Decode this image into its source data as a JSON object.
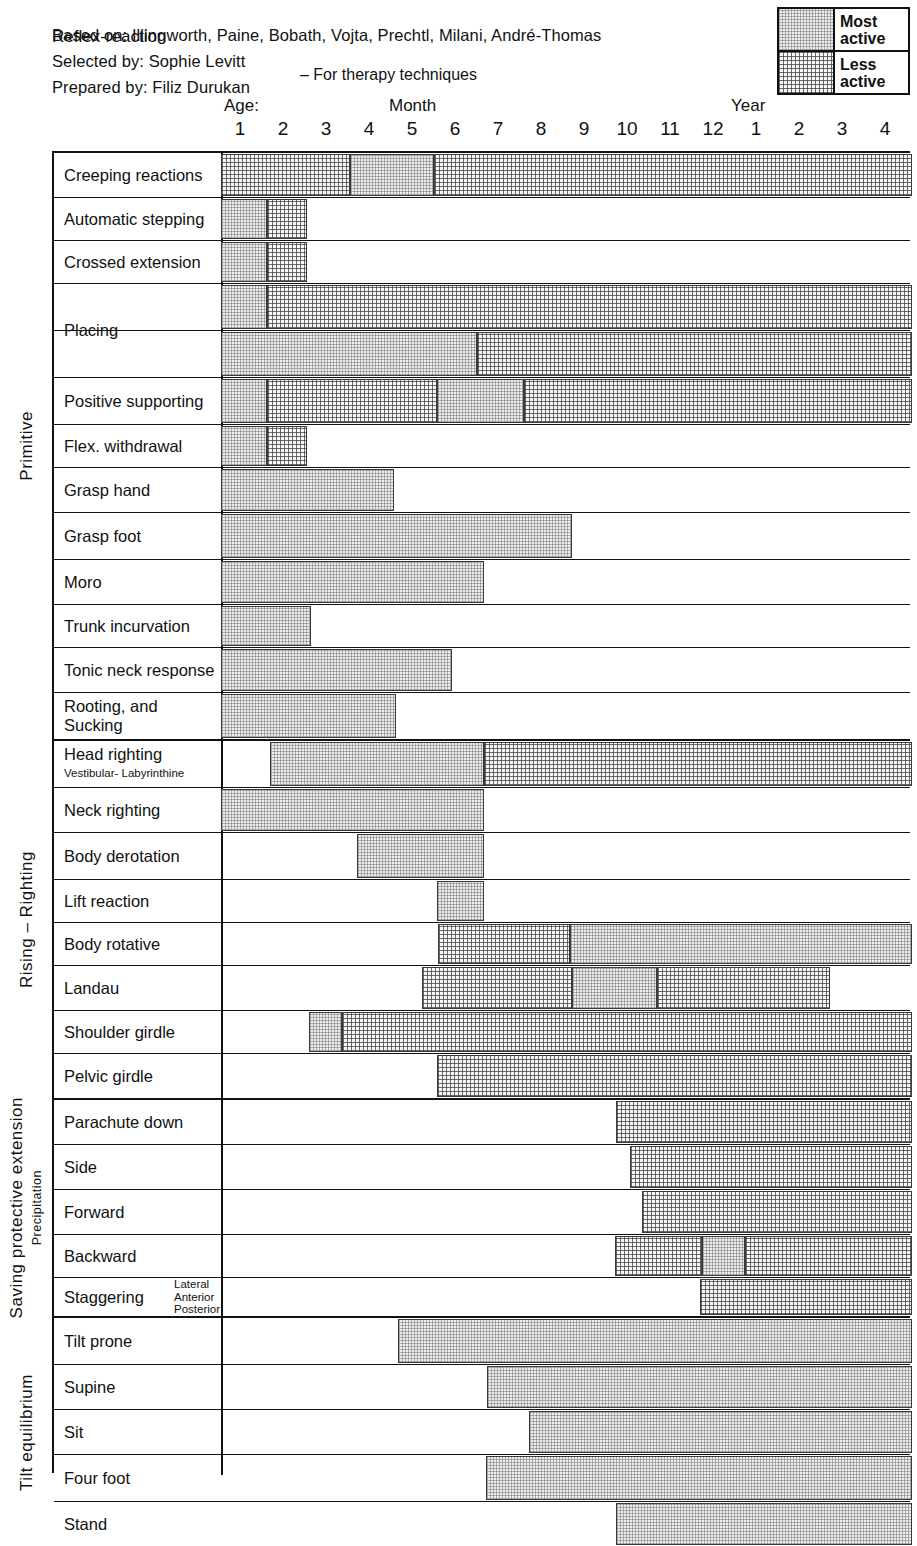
{
  "header": {
    "based_on": "Based on: Illingworth, Paine, Bobath, Vojta, Prechtl, Milani, André-Thomas",
    "selected_by": "Selected by: Sophie Levitt",
    "prepared_by": "Prepared by: Filiz Durukan",
    "therapy_note": "– For therapy techniques"
  },
  "legend": {
    "most_line1": "Most",
    "most_line2": "active",
    "less_line1": "Less",
    "less_line2": "active"
  },
  "axis": {
    "row_header": "Reflex-reaction",
    "age_word": "Age:",
    "month_word": "Month",
    "year_word": "Year",
    "tick_labels": [
      "1",
      "2",
      "3",
      "4",
      "5",
      "6",
      "7",
      "8",
      "9",
      "10",
      "11",
      "12",
      "1",
      "2",
      "3",
      "4"
    ]
  },
  "colors": {
    "most_active": "#eeeeee",
    "less_active": "#f7f7f7",
    "line": "#111111"
  },
  "chart_data": {
    "type": "bar",
    "xlabel": "Age (Months 1-12, then Years 1-4)",
    "ylabel": "Reflex-reaction",
    "grid": false,
    "legend": [
      "Most active",
      "Less active"
    ],
    "legend_position": "top-right",
    "x_axis": {
      "unit_labels": [
        "Month",
        "Year"
      ],
      "ticks": [
        "1",
        "2",
        "3",
        "4",
        "5",
        "6",
        "7",
        "8",
        "9",
        "10",
        "11",
        "12",
        "1",
        "2",
        "3",
        "4"
      ],
      "tick_px": [
        240,
        283,
        326,
        369,
        412,
        455,
        498,
        541,
        584,
        627,
        670,
        713,
        756,
        799,
        842,
        885
      ],
      "plot_left_px": 219,
      "plot_right_px": 910
    },
    "groups": [
      {
        "name": "Primitive",
        "rows": [
          {
            "label": "Creeping reactions",
            "segments": [
              {
                "type": "less",
                "from": 219,
                "to": 348
              },
              {
                "type": "most",
                "from": 348,
                "to": 432
              },
              {
                "type": "less",
                "from": 432,
                "to": 910
              }
            ]
          },
          {
            "label": "Automatic stepping",
            "segments": [
              {
                "type": "most",
                "from": 219,
                "to": 265
              },
              {
                "type": "less",
                "from": 265,
                "to": 305
              }
            ]
          },
          {
            "label": "Crossed extension",
            "segments": [
              {
                "type": "most",
                "from": 219,
                "to": 265
              },
              {
                "type": "less",
                "from": 265,
                "to": 305
              }
            ]
          },
          {
            "label": "Arms",
            "label_align": "right",
            "group_label": "Placing",
            "segments": [
              {
                "type": "most",
                "from": 219,
                "to": 265
              },
              {
                "type": "less",
                "from": 265,
                "to": 910
              }
            ]
          },
          {
            "label": "Legs",
            "label_align": "right",
            "segments": [
              {
                "type": "most",
                "from": 219,
                "to": 475
              },
              {
                "type": "less",
                "from": 475,
                "to": 910
              }
            ]
          },
          {
            "label": "Positive supporting",
            "segments": [
              {
                "type": "most",
                "from": 219,
                "to": 265
              },
              {
                "type": "less",
                "from": 265,
                "to": 435
              },
              {
                "type": "most",
                "from": 435,
                "to": 522
              },
              {
                "type": "less",
                "from": 522,
                "to": 910
              }
            ]
          },
          {
            "label": "Flex. withdrawal",
            "segments": [
              {
                "type": "most",
                "from": 219,
                "to": 265
              },
              {
                "type": "less",
                "from": 265,
                "to": 305
              }
            ]
          },
          {
            "label": "Grasp hand",
            "segments": [
              {
                "type": "most",
                "from": 219,
                "to": 392
              }
            ]
          },
          {
            "label": "Grasp foot",
            "segments": [
              {
                "type": "most",
                "from": 219,
                "to": 570
              }
            ]
          },
          {
            "label": "Moro",
            "segments": [
              {
                "type": "most",
                "from": 219,
                "to": 482
              }
            ]
          },
          {
            "label": "Trunk incurvation",
            "segments": [
              {
                "type": "most",
                "from": 219,
                "to": 309
              }
            ]
          },
          {
            "label": "Tonic neck response",
            "segments": [
              {
                "type": "most",
                "from": 219,
                "to": 450
              }
            ]
          },
          {
            "label": "Rooting, and",
            "label2": "Sucking",
            "segments": [
              {
                "type": "most",
                "from": 219,
                "to": 394
              }
            ]
          }
        ]
      },
      {
        "name": "Rising  –  Righting",
        "rows": [
          {
            "label": "Head righting",
            "sub": "Vestibular- Labyrinthine",
            "segments": [
              {
                "type": "most",
                "from": 268,
                "to": 482
              },
              {
                "type": "less",
                "from": 482,
                "to": 910
              }
            ]
          },
          {
            "label": "Neck righting",
            "segments": [
              {
                "type": "most",
                "from": 219,
                "to": 482
              }
            ]
          },
          {
            "label": "Body derotation",
            "segments": [
              {
                "type": "most",
                "from": 355,
                "to": 482
              }
            ]
          },
          {
            "label": "Lift reaction",
            "segments": [
              {
                "type": "most",
                "from": 435,
                "to": 482
              }
            ]
          },
          {
            "label": "Body rotative",
            "segments": [
              {
                "type": "less",
                "from": 436,
                "to": 568
              },
              {
                "type": "most",
                "from": 568,
                "to": 910
              }
            ]
          },
          {
            "label": "Landau",
            "segments": [
              {
                "type": "less",
                "from": 420,
                "to": 570
              },
              {
                "type": "most",
                "from": 570,
                "to": 655
              },
              {
                "type": "less",
                "from": 655,
                "to": 828
              }
            ]
          },
          {
            "label": "Shoulder girdle",
            "segments": [
              {
                "type": "most",
                "from": 307,
                "to": 340
              },
              {
                "type": "less",
                "from": 340,
                "to": 910
              }
            ]
          },
          {
            "label": "Pelvic girdle",
            "segments": [
              {
                "type": "less",
                "from": 435,
                "to": 910
              }
            ]
          }
        ]
      },
      {
        "name": "Saving protective extension",
        "side_sub": "Precipitation",
        "rows": [
          {
            "label": "Parachute down",
            "segments": [
              {
                "type": "less",
                "from": 614,
                "to": 910
              }
            ]
          },
          {
            "label": "Side",
            "segments": [
              {
                "type": "less",
                "from": 628,
                "to": 910
              }
            ]
          },
          {
            "label": "Forward",
            "segments": [
              {
                "type": "less",
                "from": 640,
                "to": 910
              }
            ]
          },
          {
            "label": "Backward",
            "segments": [
              {
                "type": "less",
                "from": 613,
                "to": 700
              },
              {
                "type": "most",
                "from": 700,
                "to": 743
              },
              {
                "type": "less",
                "from": 743,
                "to": 910
              }
            ]
          },
          {
            "label": "Staggering",
            "small_label": "Lateral\nAnterior\nPosterior",
            "segments": [
              {
                "type": "less",
                "from": 698,
                "to": 910
              }
            ]
          }
        ]
      },
      {
        "name": "Tilt equilibrium",
        "rows": [
          {
            "label": "Tilt prone",
            "segments": [
              {
                "type": "most",
                "from": 396,
                "to": 910
              }
            ]
          },
          {
            "label": "Supine",
            "segments": [
              {
                "type": "most",
                "from": 485,
                "to": 910
              }
            ]
          },
          {
            "label": "Sit",
            "segments": [
              {
                "type": "most",
                "from": 527,
                "to": 910
              }
            ]
          },
          {
            "label": "Four foot",
            "segments": [
              {
                "type": "most",
                "from": 484,
                "to": 910
              }
            ]
          },
          {
            "label": "Stand",
            "segments": [
              {
                "type": "most",
                "from": 614,
                "to": 910
              }
            ]
          }
        ]
      }
    ]
  }
}
